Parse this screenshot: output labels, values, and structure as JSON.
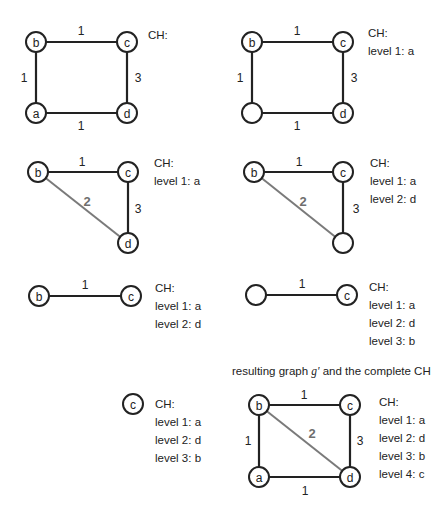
{
  "colors": {
    "edge": "#222222",
    "shortcut_edge": "#7a7a7a",
    "node_fill": "#ffffff"
  },
  "ch_header": "CH:",
  "panels": [
    {
      "id": "step0",
      "nodes": [
        {
          "id": "b",
          "label": "b",
          "x": 36,
          "y": 42
        },
        {
          "id": "c",
          "label": "c",
          "x": 127,
          "y": 42
        },
        {
          "id": "a",
          "label": "a",
          "x": 36,
          "y": 113
        },
        {
          "id": "d",
          "label": "d",
          "x": 127,
          "y": 113
        }
      ],
      "edges": [
        {
          "from": "b",
          "to": "c",
          "weight": "1",
          "lx": 81,
          "ly": 31
        },
        {
          "from": "b",
          "to": "a",
          "weight": "1",
          "lx": 24,
          "ly": 78
        },
        {
          "from": "c",
          "to": "d",
          "weight": "3",
          "lx": 138,
          "ly": 78
        },
        {
          "from": "a",
          "to": "d",
          "weight": "1",
          "lx": 81,
          "ly": 126
        }
      ],
      "ch": {
        "x": 148,
        "y": 35,
        "lines": [
          "CH:"
        ]
      }
    },
    {
      "id": "step1",
      "nodes": [
        {
          "id": "b",
          "label": "b",
          "x": 252,
          "y": 42
        },
        {
          "id": "c",
          "label": "c",
          "x": 343,
          "y": 42
        },
        {
          "id": "a",
          "label": "",
          "x": 252,
          "y": 113
        },
        {
          "id": "d",
          "label": "d",
          "x": 343,
          "y": 113
        }
      ],
      "edges": [
        {
          "from": "b",
          "to": "c",
          "weight": "1",
          "lx": 297,
          "ly": 31
        },
        {
          "from": "b",
          "to": "a",
          "weight": "1",
          "lx": 240,
          "ly": 78
        },
        {
          "from": "c",
          "to": "d",
          "weight": "3",
          "lx": 354,
          "ly": 78
        },
        {
          "from": "a",
          "to": "d",
          "weight": "1",
          "lx": 297,
          "ly": 126
        }
      ],
      "ch": {
        "x": 368,
        "y": 33,
        "lines": [
          "CH:",
          "level 1: a"
        ]
      }
    },
    {
      "id": "step2",
      "nodes": [
        {
          "id": "b",
          "label": "b",
          "x": 38,
          "y": 172
        },
        {
          "id": "c",
          "label": "c",
          "x": 128,
          "y": 172
        },
        {
          "id": "d",
          "label": "d",
          "x": 128,
          "y": 243
        }
      ],
      "edges": [
        {
          "from": "b",
          "to": "c",
          "weight": "1",
          "lx": 82,
          "ly": 162
        },
        {
          "from": "c",
          "to": "d",
          "weight": "3",
          "lx": 138,
          "ly": 209
        },
        {
          "from": "b",
          "to": "d",
          "weight": "2",
          "lx": 87,
          "ly": 201,
          "shortcut": true
        }
      ],
      "ch": {
        "x": 154,
        "y": 163,
        "lines": [
          "CH:",
          "level 1: a"
        ]
      }
    },
    {
      "id": "step3",
      "nodes": [
        {
          "id": "b",
          "label": "b",
          "x": 254,
          "y": 172
        },
        {
          "id": "c",
          "label": "c",
          "x": 343,
          "y": 172
        },
        {
          "id": "d",
          "label": "",
          "x": 343,
          "y": 243
        }
      ],
      "edges": [
        {
          "from": "b",
          "to": "c",
          "weight": "1",
          "lx": 299,
          "ly": 162
        },
        {
          "from": "c",
          "to": "d",
          "weight": "3",
          "lx": 356,
          "ly": 209
        },
        {
          "from": "b",
          "to": "d",
          "weight": "2",
          "lx": 303,
          "ly": 201,
          "shortcut": true
        }
      ],
      "ch": {
        "x": 370,
        "y": 163,
        "lines": [
          "CH:",
          "level 1: a",
          "level 2: d"
        ]
      }
    },
    {
      "id": "step4",
      "nodes": [
        {
          "id": "b",
          "label": "b",
          "x": 39,
          "y": 296
        },
        {
          "id": "c",
          "label": "c",
          "x": 131,
          "y": 296
        }
      ],
      "edges": [
        {
          "from": "b",
          "to": "c",
          "weight": "1",
          "lx": 85,
          "ly": 285
        }
      ],
      "ch": {
        "x": 155,
        "y": 288,
        "lines": [
          "CH:",
          "level 1: a",
          "level 2: d"
        ]
      }
    },
    {
      "id": "step5",
      "nodes": [
        {
          "id": "b",
          "label": "",
          "x": 256,
          "y": 295
        },
        {
          "id": "c",
          "label": "c",
          "x": 347,
          "y": 295
        }
      ],
      "edges": [
        {
          "from": "b",
          "to": "c",
          "weight": "1",
          "lx": 302,
          "ly": 284
        }
      ],
      "ch": {
        "x": 369,
        "y": 287,
        "lines": [
          "CH:",
          "level 1: a",
          "level 2: d",
          "level 3: b"
        ]
      }
    },
    {
      "id": "step6",
      "nodes": [
        {
          "id": "c",
          "label": "c",
          "x": 133,
          "y": 404
        }
      ],
      "edges": [],
      "ch": {
        "x": 155,
        "y": 404,
        "lines": [
          "CH:",
          "level 1: a",
          "level 2: d",
          "level 3: b"
        ]
      }
    },
    {
      "id": "result",
      "caption": {
        "prefix": "resulting graph ",
        "graph_name": "g'",
        "suffix": " and the complete CH",
        "x": 232,
        "y": 373
      },
      "nodes": [
        {
          "id": "b",
          "label": "b",
          "x": 259,
          "y": 405
        },
        {
          "id": "c",
          "label": "c",
          "x": 350,
          "y": 405
        },
        {
          "id": "a",
          "label": "a",
          "x": 259,
          "y": 477
        },
        {
          "id": "d",
          "label": "d",
          "x": 350,
          "y": 477
        }
      ],
      "edges": [
        {
          "from": "b",
          "to": "c",
          "weight": "1",
          "lx": 304,
          "ly": 395
        },
        {
          "from": "b",
          "to": "a",
          "weight": "1",
          "lx": 248,
          "ly": 441
        },
        {
          "from": "c",
          "to": "d",
          "weight": "3",
          "lx": 360,
          "ly": 441
        },
        {
          "from": "a",
          "to": "d",
          "weight": "1",
          "lx": 305,
          "ly": 491
        },
        {
          "from": "b",
          "to": "d",
          "weight": "2",
          "lx": 312,
          "ly": 433,
          "shortcut": true
        }
      ],
      "ch": {
        "x": 379,
        "y": 402,
        "lines": [
          "CH:",
          "level 1: a",
          "level 2: d",
          "level 3: b",
          "level 4: c"
        ]
      }
    }
  ]
}
